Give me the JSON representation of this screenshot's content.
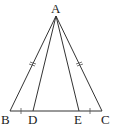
{
  "diagram": {
    "type": "geometry",
    "colors": {
      "line": "#333333",
      "text": "#222222",
      "background": "#ffffff"
    },
    "points": {
      "A": {
        "label": "A",
        "x": 56,
        "y": 16
      },
      "B": {
        "label": "B",
        "x": 10,
        "y": 111
      },
      "C": {
        "label": "C",
        "x": 102,
        "y": 111
      },
      "D": {
        "label": "D",
        "x": 33,
        "y": 111
      },
      "E": {
        "label": "E",
        "x": 79,
        "y": 111
      }
    },
    "segments": [
      "AB",
      "AC",
      "BC",
      "AD",
      "AE"
    ],
    "equal_marks": [
      {
        "segments": [
          "AB",
          "AC"
        ],
        "mark": "double-tick"
      },
      {
        "segments": [
          "BD",
          "EC"
        ],
        "mark": "single-tick"
      }
    ]
  }
}
